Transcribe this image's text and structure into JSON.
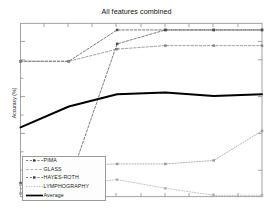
{
  "figure": {
    "title": "All features combined",
    "ylabel": "Accuracy (%)",
    "xlabel": "",
    "background": "#ffffff"
  },
  "legend": {
    "position": "lower-left",
    "entries": [
      {
        "label": "PIMA",
        "style": "dashed-marker",
        "color": "#4d4d4d"
      },
      {
        "label": "GLASS",
        "style": "dashed",
        "color": "#808080"
      },
      {
        "label": "HAYES-ROTH",
        "style": "dashed-marker",
        "color": "#4d4d4d"
      },
      {
        "label": "LYMPHOGRAPHY",
        "style": "dotted",
        "color": "#999999"
      },
      {
        "label": "Average",
        "style": "solid-thick",
        "color": "#000000"
      }
    ]
  },
  "axes": {
    "y_ticks_count": 9,
    "x_ticks_count": 11,
    "y_tick_labels": [],
    "x_tick_labels": [],
    "grid": false
  },
  "chart_data": {
    "type": "line",
    "title": "All features combined",
    "xlabel": "",
    "ylabel": "Accuracy (%)",
    "x": [
      1,
      2,
      3,
      4,
      5,
      6
    ],
    "xlim": [
      1,
      6
    ],
    "ylim": [
      0,
      100
    ],
    "grid": false,
    "legend_position": "lower left",
    "series": [
      {
        "name": "PIMA",
        "values": [
          78,
          78,
          96,
          96,
          96,
          96
        ],
        "linestyle": "dashed",
        "marker": "square",
        "color": "#4d4d4d"
      },
      {
        "name": "GLASS",
        "values": [
          78,
          78,
          85,
          87,
          87,
          87
        ],
        "linestyle": "dashed",
        "marker": "square",
        "color": "#808080"
      },
      {
        "name": "HAYES-ROTH",
        "values": [
          8,
          8,
          88,
          96,
          96,
          96
        ],
        "linestyle": "dashed",
        "marker": "square",
        "color": "#4d4d4d"
      },
      {
        "name": "LYMPHOGRAPHY",
        "values": [
          2,
          18,
          19,
          19,
          21,
          38
        ],
        "linestyle": "dotted",
        "marker": "square",
        "color": "#999999"
      },
      {
        "name": "Average",
        "values": [
          40,
          52,
          59,
          60,
          58,
          59
        ],
        "linestyle": "solid",
        "marker": "none",
        "color": "#000000",
        "linewidth": 2
      },
      {
        "name": "declining-series",
        "values": [
          7,
          7,
          10,
          5,
          1,
          1
        ],
        "linestyle": "dotted",
        "marker": "square",
        "color": "#b0b0b0"
      }
    ]
  }
}
